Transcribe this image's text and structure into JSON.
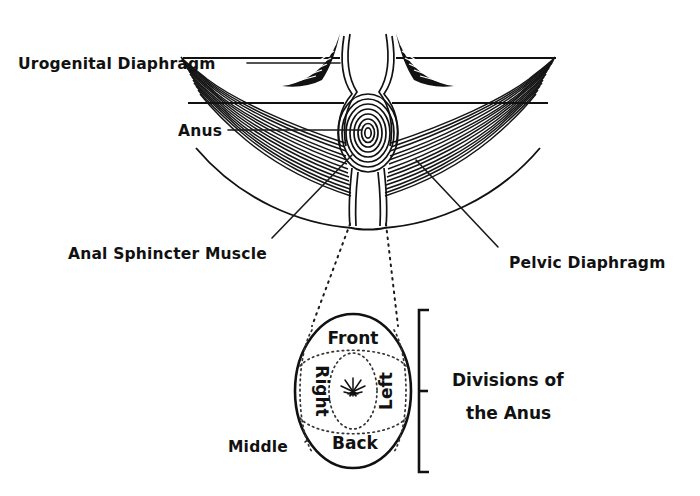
{
  "figure": {
    "background_color": "#ffffff",
    "ink_color": "#111111"
  },
  "callouts": [
    {
      "id": "urogenital-diaphragm",
      "label": "Urogenital Diaphragm"
    },
    {
      "id": "anus",
      "label": "Anus"
    },
    {
      "id": "anal-sphincter-muscle",
      "label": "Anal Sphincter Muscle"
    },
    {
      "id": "pelvic-diaphragm",
      "label": "Pelvic Diaphragm"
    },
    {
      "id": "middle",
      "label": "Middle"
    }
  ],
  "divisions": {
    "bracket_title_line1": "Divisions of",
    "bracket_title_line2": "the Anus",
    "regions": [
      {
        "id": "front",
        "label": "Front",
        "orientation": "horizontal"
      },
      {
        "id": "right",
        "label": "Right",
        "orientation": "vertical-down"
      },
      {
        "id": "left",
        "label": "Left",
        "orientation": "vertical-up"
      },
      {
        "id": "back",
        "label": "Back",
        "orientation": "horizontal"
      },
      {
        "id": "middle",
        "label": "Middle",
        "orientation": "horizontal"
      }
    ],
    "center_marker": "star-burst-icon"
  }
}
